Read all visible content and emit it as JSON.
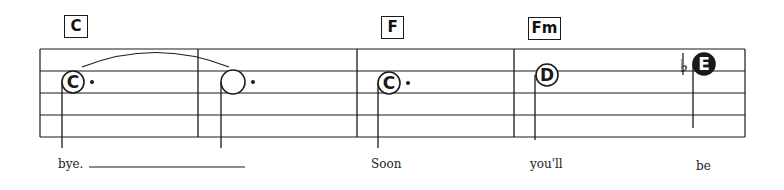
{
  "chords": [
    {
      "label": "C",
      "x": 64,
      "y": 15,
      "w": 24,
      "h": 23
    },
    {
      "label": "F",
      "x": 381,
      "y": 16,
      "w": 23,
      "h": 23
    },
    {
      "label": "Fm",
      "x": 528,
      "y": 17,
      "w": 33,
      "h": 23
    }
  ],
  "staff": {
    "left": 40,
    "right": 745,
    "lines_y": [
      49,
      71,
      93,
      115,
      137
    ],
    "barlines_x": [
      198,
      357,
      514
    ]
  },
  "notes": [
    {
      "letter": "C",
      "cx": 73,
      "cy": 82,
      "r": 11,
      "filled": false,
      "dotted": true,
      "stem_x": 62,
      "stem_bottom": 148
    },
    {
      "letter": "",
      "cx": 233,
      "cy": 82,
      "r": 12,
      "filled": false,
      "dotted": true,
      "stem_x": 221,
      "stem_bottom": 148
    },
    {
      "letter": "C",
      "cx": 389,
      "cy": 83,
      "r": 11,
      "filled": false,
      "dotted": true,
      "stem_x": 378,
      "stem_bottom": 148
    },
    {
      "letter": "D",
      "cx": 547,
      "cy": 75,
      "r": 11,
      "filled": false,
      "dotted": false,
      "stem_x": 535,
      "stem_bottom": 140
    },
    {
      "letter": "E",
      "cx": 704,
      "cy": 64,
      "r": 11,
      "filled": true,
      "dotted": false,
      "stem_x": 693,
      "stem_bottom": 128,
      "accidental": "♭"
    }
  ],
  "tie": {
    "from_x": 82,
    "to_x": 229,
    "y": 67,
    "peak_y": 52
  },
  "lyrics": [
    {
      "text": "bye.",
      "x": 58,
      "y": 157
    },
    {
      "text": "Soon",
      "x": 371,
      "y": 157
    },
    {
      "text": "you'll",
      "x": 530,
      "y": 157
    },
    {
      "text": "be",
      "x": 696,
      "y": 159
    }
  ],
  "extender": {
    "x1": 89,
    "x2": 245,
    "y": 167
  },
  "colors": {
    "ink": "#1a1a1a",
    "paper": "#ffffff"
  }
}
